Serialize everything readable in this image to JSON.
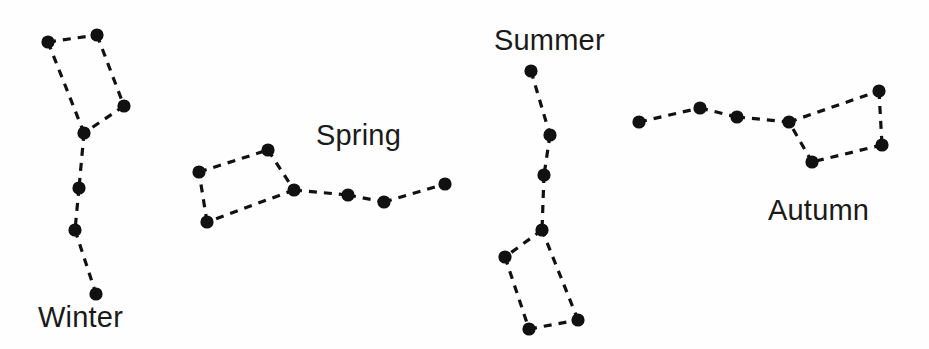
{
  "figure": {
    "background_color": "#fefefe",
    "ink_color": "#111111",
    "width": 929,
    "height": 349,
    "node_radius": 6.6,
    "edge_dash": "8 7",
    "edge_width": 3.2
  },
  "chart_data": {
    "type": "scatter",
    "xlabel": "",
    "ylabel": "",
    "xlim": [
      0,
      929
    ],
    "ylim": [
      349,
      0
    ],
    "grid": false,
    "legend": "none",
    "note": "Four dashed-line star charts; each node is a star, each edge a connecting line.",
    "series": [
      {
        "name": "Winter",
        "label": "Winter",
        "label_x": 38,
        "label_y": 327,
        "points": [
          {
            "id": "w1",
            "x": 48,
            "y": 42
          },
          {
            "id": "w2",
            "x": 97,
            "y": 35
          },
          {
            "id": "w3",
            "x": 124,
            "y": 106
          },
          {
            "id": "w4",
            "x": 84,
            "y": 133
          },
          {
            "id": "w5",
            "x": 79,
            "y": 188
          },
          {
            "id": "w6",
            "x": 75,
            "y": 230
          },
          {
            "id": "w7",
            "x": 96,
            "y": 294
          }
        ],
        "edges": [
          [
            "w1",
            "w2"
          ],
          [
            "w2",
            "w3"
          ],
          [
            "w3",
            "w4"
          ],
          [
            "w4",
            "w1"
          ],
          [
            "w4",
            "w5"
          ],
          [
            "w5",
            "w6"
          ],
          [
            "w6",
            "w7"
          ]
        ]
      },
      {
        "name": "Spring",
        "label": "Spring",
        "label_x": 316,
        "label_y": 145,
        "points": [
          {
            "id": "s1",
            "x": 199,
            "y": 172
          },
          {
            "id": "s2",
            "x": 268,
            "y": 150
          },
          {
            "id": "s3",
            "x": 294,
            "y": 190
          },
          {
            "id": "s4",
            "x": 207,
            "y": 222
          },
          {
            "id": "s5",
            "x": 348,
            "y": 195
          },
          {
            "id": "s6",
            "x": 384,
            "y": 202
          },
          {
            "id": "s7",
            "x": 445,
            "y": 184
          }
        ],
        "edges": [
          [
            "s1",
            "s2"
          ],
          [
            "s2",
            "s3"
          ],
          [
            "s3",
            "s4"
          ],
          [
            "s4",
            "s1"
          ],
          [
            "s3",
            "s5"
          ],
          [
            "s5",
            "s6"
          ],
          [
            "s6",
            "s7"
          ]
        ]
      },
      {
        "name": "Summer",
        "label": "Summer",
        "label_x": 494,
        "label_y": 50,
        "points": [
          {
            "id": "u1",
            "x": 531,
            "y": 71
          },
          {
            "id": "u2",
            "x": 550,
            "y": 135
          },
          {
            "id": "u3",
            "x": 544,
            "y": 175
          },
          {
            "id": "u4",
            "x": 542,
            "y": 230
          },
          {
            "id": "u5",
            "x": 505,
            "y": 257
          },
          {
            "id": "u6",
            "x": 529,
            "y": 329
          },
          {
            "id": "u7",
            "x": 578,
            "y": 320
          }
        ],
        "edges": [
          [
            "u1",
            "u2"
          ],
          [
            "u2",
            "u3"
          ],
          [
            "u3",
            "u4"
          ],
          [
            "u4",
            "u5"
          ],
          [
            "u5",
            "u6"
          ],
          [
            "u6",
            "u7"
          ],
          [
            "u7",
            "u4"
          ]
        ]
      },
      {
        "name": "Autumn",
        "label": "Autumn",
        "label_x": 768,
        "label_y": 220,
        "points": [
          {
            "id": "a1",
            "x": 639,
            "y": 122
          },
          {
            "id": "a2",
            "x": 700,
            "y": 108
          },
          {
            "id": "a3",
            "x": 737,
            "y": 117
          },
          {
            "id": "a4",
            "x": 789,
            "y": 122
          },
          {
            "id": "a5",
            "x": 879,
            "y": 91
          },
          {
            "id": "a6",
            "x": 882,
            "y": 145
          },
          {
            "id": "a7",
            "x": 812,
            "y": 162
          }
        ],
        "edges": [
          [
            "a1",
            "a2"
          ],
          [
            "a2",
            "a3"
          ],
          [
            "a3",
            "a4"
          ],
          [
            "a4",
            "a5"
          ],
          [
            "a5",
            "a6"
          ],
          [
            "a6",
            "a7"
          ],
          [
            "a7",
            "a4"
          ]
        ]
      }
    ]
  }
}
